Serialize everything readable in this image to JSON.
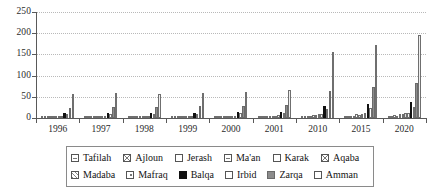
{
  "chart_data": {
    "type": "bar",
    "title": "",
    "subtitle": "",
    "xlabel": "",
    "ylabel": "",
    "ylim": [
      0,
      250
    ],
    "yticks": [
      0,
      50,
      100,
      150,
      200,
      250
    ],
    "grid": true,
    "legend_position": "bottom",
    "categories": [
      "1996",
      "1997",
      "1998",
      "1999",
      "2000",
      "2001",
      "2010",
      "2015",
      "2020"
    ],
    "series": [
      {
        "name": "Tafilah",
        "swatch": "lines-horizontal",
        "values": [
          1,
          1,
          1,
          1,
          1,
          1,
          2,
          2,
          3
        ]
      },
      {
        "name": "Ajloun",
        "swatch": "cross-hatch",
        "values": [
          1,
          1,
          1,
          1,
          1,
          2,
          3,
          3,
          4
        ]
      },
      {
        "name": "Jerash",
        "swatch": "empty",
        "values": [
          2,
          2,
          2,
          2,
          2,
          2,
          5,
          5,
          6
        ]
      },
      {
        "name": "Ma'an",
        "swatch": "lines-horizontal",
        "values": [
          2,
          2,
          2,
          2,
          2,
          2,
          5,
          5,
          5
        ]
      },
      {
        "name": "Karak",
        "swatch": "empty-small",
        "values": [
          4,
          4,
          4,
          4,
          4,
          4,
          8,
          9,
          10
        ]
      },
      {
        "name": "Aqaba",
        "swatch": "cross-hatch",
        "values": [
          3,
          3,
          3,
          3,
          3,
          3,
          7,
          8,
          9
        ]
      },
      {
        "name": "Madaba",
        "swatch": "diagonal",
        "values": [
          4,
          4,
          4,
          4,
          5,
          5,
          9,
          10,
          11
        ]
      },
      {
        "name": "Mafraq",
        "swatch": "dotted",
        "values": [
          5,
          5,
          5,
          5,
          5,
          6,
          10,
          11,
          12
        ]
      },
      {
        "name": "Balqa",
        "swatch": "solid-black",
        "values": [
          12,
          12,
          13,
          13,
          14,
          14,
          28,
          33,
          38
        ]
      },
      {
        "name": "Irbid",
        "swatch": "empty",
        "values": [
          9,
          9,
          10,
          10,
          11,
          11,
          22,
          24,
          26
        ]
      },
      {
        "name": "Zarqa",
        "swatch": "solid-gray",
        "values": [
          24,
          25,
          27,
          28,
          29,
          31,
          63,
          72,
          82
        ]
      },
      {
        "name": "Amman",
        "swatch": "empty-light",
        "values": [
          57,
          60,
          57,
          60,
          62,
          67,
          155,
          172,
          195
        ]
      }
    ]
  },
  "axis": {
    "y_labels": [
      "250",
      "200",
      "150",
      "100",
      "50",
      "0"
    ],
    "x_labels": [
      "1996",
      "1997",
      "1998",
      "1999",
      "2000",
      "2001",
      "2010",
      "2015",
      "2020"
    ]
  },
  "legend": {
    "row1": [
      {
        "label": "Tafilah",
        "swatch": "lines-horizontal"
      },
      {
        "label": "Ajloun",
        "swatch": "cross-hatch"
      },
      {
        "label": "Jerash",
        "swatch": "empty"
      },
      {
        "label": "Ma'an",
        "swatch": "lines-horizontal"
      },
      {
        "label": "Karak",
        "swatch": "empty-small"
      },
      {
        "label": "Aqaba",
        "swatch": "cross-hatch"
      }
    ],
    "row2": [
      {
        "label": "Madaba",
        "swatch": "diagonal"
      },
      {
        "label": "Mafraq",
        "swatch": "dotted"
      },
      {
        "label": "Balqa",
        "swatch": "solid-black"
      },
      {
        "label": "Irbid",
        "swatch": "empty"
      },
      {
        "label": "Zarqa",
        "swatch": "solid-gray"
      },
      {
        "label": "Amman",
        "swatch": "empty-light"
      }
    ]
  },
  "colors": {
    "axis": "#595959",
    "grid": "#b9b9b9",
    "balqa": "#111111",
    "zarqa": "#8c8c8c",
    "amman": "#efefef",
    "background": "#ffffff"
  }
}
